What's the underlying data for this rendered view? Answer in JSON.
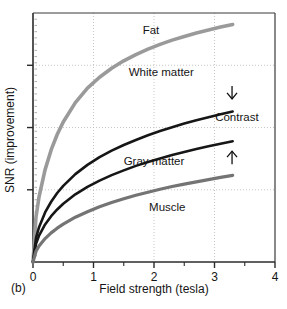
{
  "figure": {
    "panel_label": "(b)",
    "background_color": "#ffffff"
  },
  "chart_data": {
    "type": "line",
    "title": "",
    "subtitle": "",
    "xlabel": "Field strength (tesla)",
    "ylabel": "SNR (improvement)",
    "xlim": [
      0,
      4
    ],
    "ylim": [
      0,
      1
    ],
    "xticks": [
      0,
      1,
      2,
      3,
      4
    ],
    "xtick_labels": [
      "0",
      "1",
      "2",
      "3",
      "4"
    ],
    "xminor_ticks": [
      0.5,
      1.5,
      2.5,
      3.5
    ],
    "yticks": [
      0.29,
      0.54,
      0.79
    ],
    "ytick_labels": [
      "",
      "",
      ""
    ],
    "grid": true,
    "grid_axes": "both",
    "legend": "inline-labels",
    "legend_position": "inline",
    "x": [
      0,
      0.05,
      0.1,
      0.2,
      0.3,
      0.4,
      0.5,
      0.7,
      0.9,
      1.1,
      1.3,
      1.5,
      1.7,
      1.9,
      2.1,
      2.3,
      2.5,
      2.7,
      2.9,
      3.1,
      3.3
    ],
    "series": [
      {
        "name": "Fat",
        "color": "#9a9a9a",
        "label": "Fat",
        "label_x": 1.95,
        "label_y": 0.915,
        "values": [
          0.0,
          0.182,
          0.262,
          0.371,
          0.45,
          0.512,
          0.562,
          0.64,
          0.698,
          0.742,
          0.778,
          0.808,
          0.833,
          0.855,
          0.874,
          0.891,
          0.906,
          0.92,
          0.932,
          0.944,
          0.954
        ]
      },
      {
        "name": "White matter",
        "color": "#161616",
        "label": "White matter",
        "label_x": 2.12,
        "label_y": 0.745,
        "values": [
          0.0,
          0.097,
          0.14,
          0.199,
          0.242,
          0.277,
          0.306,
          0.353,
          0.39,
          0.421,
          0.447,
          0.47,
          0.49,
          0.509,
          0.526,
          0.541,
          0.556,
          0.569,
          0.581,
          0.593,
          0.604
        ]
      },
      {
        "name": "Gray matter",
        "color": "#161616",
        "label": "Gray matter",
        "label_x": 2.0,
        "label_y": 0.39,
        "values": [
          0.0,
          0.073,
          0.106,
          0.151,
          0.184,
          0.211,
          0.234,
          0.272,
          0.302,
          0.327,
          0.349,
          0.368,
          0.386,
          0.402,
          0.416,
          0.43,
          0.442,
          0.454,
          0.465,
          0.475,
          0.485
        ]
      },
      {
        "name": "Muscle",
        "color": "#747474",
        "label": "Muscle",
        "label_x": 2.22,
        "label_y": 0.205,
        "values": [
          0.0,
          0.043,
          0.064,
          0.094,
          0.117,
          0.136,
          0.152,
          0.18,
          0.202,
          0.222,
          0.239,
          0.254,
          0.268,
          0.28,
          0.292,
          0.303,
          0.313,
          0.322,
          0.331,
          0.34,
          0.348
        ]
      }
    ],
    "annotations": [
      {
        "name": "contrast",
        "label": "Contrast",
        "label_x": 3.37,
        "label_y": 0.565,
        "arrow_top_x": 3.29,
        "arrow_top_y": 0.655,
        "arrow_bottom_x": 3.29,
        "arrow_bottom_y": 0.445
      }
    ]
  }
}
